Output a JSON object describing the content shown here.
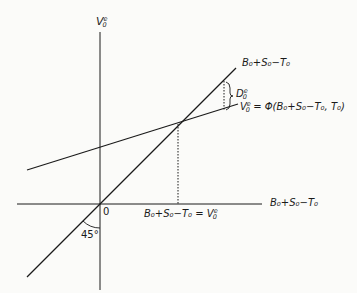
{
  "diagram": {
    "y_axis_label": {
      "base": "V",
      "sub": "0",
      "sup": "e"
    },
    "x_axis_label": "B₀+S₀−T₀",
    "origin_label": "0",
    "angle_label": "45°",
    "line_45_label": "B₀+S₀−T₀",
    "gap_label": {
      "base": "D",
      "sub": "0",
      "sup": "e"
    },
    "function_label": {
      "lhs_base": "V",
      "lhs_sub": "0",
      "lhs_sup": "e",
      "rhs": "= Φ(B₀+S₀−T₀, T₀)"
    },
    "equilibrium_label": {
      "lhs": "B₀+S₀−T₀ = ",
      "rhs_base": "V",
      "rhs_sub": "0",
      "rhs_sup": "e"
    }
  },
  "colors": {
    "ink": "#1a1a1a",
    "background": "#fbfbf9"
  }
}
